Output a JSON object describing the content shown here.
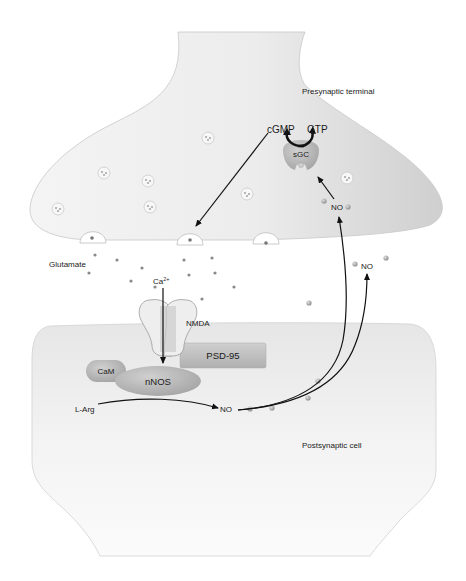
{
  "diagram": {
    "presynaptic_label": "Presynaptic terminal",
    "postsynaptic_label": "Postsynaptic cell",
    "glutamate_label": "Glutamate",
    "calcium_label": "Ca",
    "calcium_charge": "2+",
    "nmda_label": "NMDA",
    "psd95_label": "PSD-95",
    "cam_label": "CaM",
    "nnos_label": "nNOS",
    "larg_label": "L-Arg",
    "no_postsynaptic_label": "NO",
    "no_presynaptic_label": "NO",
    "no_cleft_label": "NO",
    "sgc_label": "sGC",
    "cgmp_label": "cGMP",
    "gtp_label": "GTP"
  },
  "colors": {
    "cell_fill": "#f2f2f2",
    "cell_shade": "#d9d9d9",
    "protein_fill": "#b5b5b5",
    "psd95_fill": "#bcbcbc",
    "arrow": "#111111",
    "particle": "#8a8a8a"
  }
}
